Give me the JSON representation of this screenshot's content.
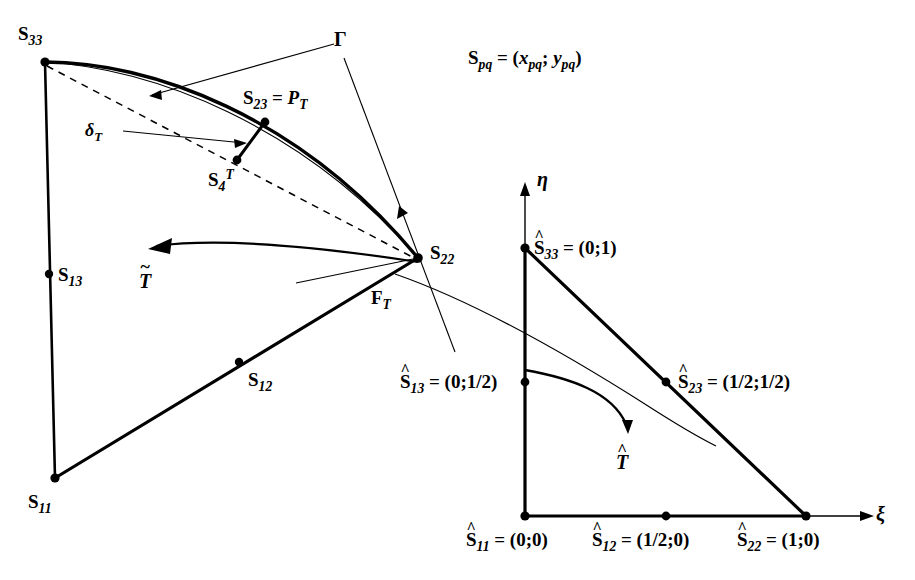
{
  "figure": {
    "background_color": "#ffffff",
    "stroke_color": "#000000"
  },
  "legend_note": {
    "text": "S",
    "subscript": "pq",
    "equals": " = (",
    "x_sym": "x",
    "x_sub": "pq",
    "semi": "; ",
    "y_sym": "y",
    "y_sub": "pq",
    "close": ")",
    "full_text": "S_pq = (x_pq; y_pq)"
  },
  "physical_triangle": {
    "name": "curvilinear-triangle",
    "vertices": [
      {
        "id": "S33",
        "base": "S",
        "sub": "33",
        "label": "S_33",
        "x": 45,
        "y": 62
      },
      {
        "id": "S11",
        "base": "S",
        "sub": "11",
        "label": "S_11",
        "x": 55,
        "y": 478
      },
      {
        "id": "S22",
        "base": "S",
        "sub": "22",
        "label": "S_22",
        "x": 418,
        "y": 258
      }
    ],
    "midside_nodes": [
      {
        "id": "S13",
        "base": "S",
        "sub": "13",
        "label": "S_13",
        "x": 49,
        "y": 274
      },
      {
        "id": "S12",
        "base": "S",
        "sub": "12",
        "label": "S_12",
        "x": 239,
        "y": 362
      },
      {
        "id": "S23",
        "base": "S",
        "sub": "23",
        "label": "S_23 = P_T",
        "x": 265,
        "y": 122
      }
    ],
    "extra_nodes": [
      {
        "id": "S4T",
        "base": "S",
        "sub": "4",
        "sup": "T",
        "label": "S_4^T",
        "x": 237,
        "y": 160
      }
    ],
    "curve_label": {
      "id": "Gamma",
      "label": "Γ",
      "x": 341,
      "y": 42
    },
    "deviation_label": {
      "id": "deltaT",
      "base": "δ",
      "sub": "T",
      "label": "δ_T",
      "x": 92,
      "y": 132
    },
    "face_label": {
      "id": "FT",
      "base": "F",
      "sub": "T",
      "label": "F_T",
      "x": 378,
      "y": 297
    },
    "map_label": {
      "id": "Ttilde",
      "base": "T",
      "accent": "~",
      "label": "T̃",
      "x": 145,
      "y": 281
    }
  },
  "reference_triangle": {
    "name": "reference-unit-triangle",
    "axes": {
      "xi": {
        "label": "ξ",
        "x": 880,
        "y": 510
      },
      "eta": {
        "label": "η",
        "x": 540,
        "y": 178
      }
    },
    "nodes": [
      {
        "id": "Shat11",
        "base": "S",
        "sub": "11",
        "coords": "(0;0)",
        "label": "Ŝ_11 = (0;0)",
        "px": 525,
        "py": 516
      },
      {
        "id": "Shat12",
        "base": "S",
        "sub": "12",
        "coords": "(1/2;0)",
        "label": "Ŝ_12 = (1/2;0)",
        "px": 666,
        "py": 516
      },
      {
        "id": "Shat22",
        "base": "S",
        "sub": "22",
        "coords": "(1;0)",
        "label": "Ŝ_22 = (1;0)",
        "px": 806,
        "py": 516
      },
      {
        "id": "Shat13",
        "base": "S",
        "sub": "13",
        "coords": "(0;1/2)",
        "label": "Ŝ_13 = (0;1/2)",
        "px": 525,
        "py": 382
      },
      {
        "id": "Shat23",
        "base": "S",
        "sub": "23",
        "coords": "(1/2;1/2)",
        "label": "Ŝ_23 = (1/2;1/2)",
        "px": 666,
        "py": 382
      },
      {
        "id": "Shat33",
        "base": "S",
        "sub": "33",
        "coords": "(0;1)",
        "label": "Ŝ_33 = (0;1)",
        "px": 525,
        "py": 248
      }
    ],
    "map_label": {
      "id": "That",
      "base": "T",
      "accent": "^",
      "label": "T̂",
      "x": 621,
      "y": 448
    }
  },
  "colors": {
    "ink": "#000000",
    "paper": "#ffffff"
  }
}
